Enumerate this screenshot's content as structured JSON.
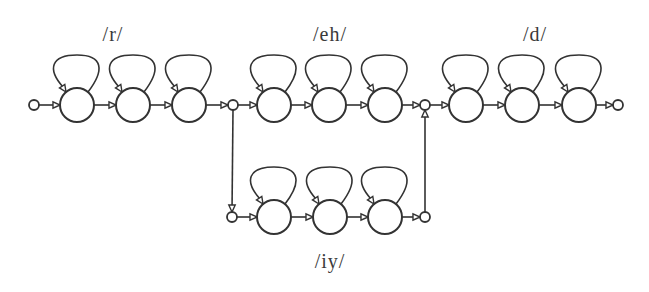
{
  "diagram": {
    "colors": {
      "stroke": "#333333",
      "background": "#ffffff",
      "text": "#3a3a3a"
    },
    "state_radius": 17,
    "node_radius": 5,
    "labels": [
      {
        "id": "r",
        "text": "/r/",
        "x": 113,
        "y": 23
      },
      {
        "id": "eh",
        "text": "/eh/",
        "x": 330,
        "y": 23
      },
      {
        "id": "d",
        "text": "/d/",
        "x": 535,
        "y": 23
      },
      {
        "id": "iy",
        "text": "/iy/",
        "x": 330,
        "y": 250
      }
    ],
    "phones": [
      {
        "id": "r",
        "states": [
          {
            "x": 77,
            "y": 105
          },
          {
            "x": 133,
            "y": 105
          },
          {
            "x": 189,
            "y": 105
          }
        ]
      },
      {
        "id": "eh",
        "states": [
          {
            "x": 274,
            "y": 105
          },
          {
            "x": 329,
            "y": 105
          },
          {
            "x": 385,
            "y": 105
          }
        ]
      },
      {
        "id": "d",
        "states": [
          {
            "x": 466,
            "y": 105
          },
          {
            "x": 522,
            "y": 105
          },
          {
            "x": 579,
            "y": 105
          }
        ]
      },
      {
        "id": "iy",
        "states": [
          {
            "x": 274,
            "y": 217
          },
          {
            "x": 330,
            "y": 217
          },
          {
            "x": 385,
            "y": 217
          }
        ]
      }
    ],
    "nodes": [
      {
        "id": "start",
        "x": 34,
        "y": 105
      },
      {
        "id": "split",
        "x": 233,
        "y": 105
      },
      {
        "id": "merge",
        "x": 425,
        "y": 105
      },
      {
        "id": "iy-in",
        "x": 232,
        "y": 217
      },
      {
        "id": "iy-out",
        "x": 425,
        "y": 217
      },
      {
        "id": "end",
        "x": 618,
        "y": 105
      }
    ]
  }
}
